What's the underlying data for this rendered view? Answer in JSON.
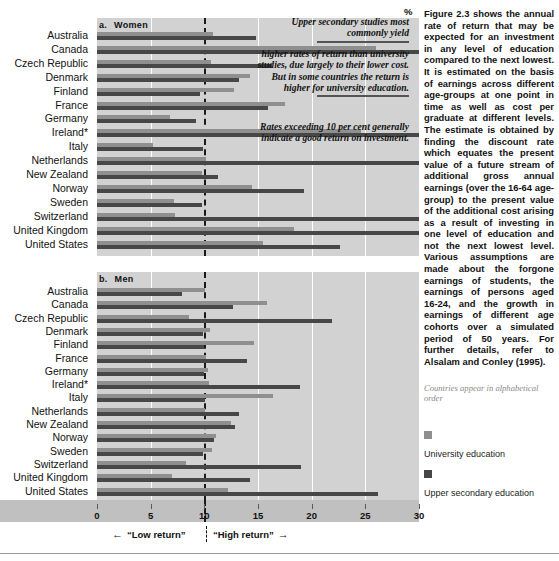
{
  "chart_data": {
    "type": "bar",
    "orientation": "horizontal",
    "xlabel": "%",
    "xlim": [
      0,
      30
    ],
    "xticks": [
      0,
      5,
      10,
      15,
      20,
      25,
      30
    ],
    "xtick_labels": [
      "0",
      "5",
      "10",
      "15",
      "20",
      "25",
      "30"
    ],
    "unit": "%",
    "grid": true,
    "reference_line": 10,
    "reference_line_style": "dashed",
    "legend_position": "right",
    "categories": [
      "Australia",
      "Canada",
      "Czech Republic",
      "Denmark",
      "Finland",
      "France",
      "Germany",
      "Ireland*",
      "Italy",
      "Netherlands",
      "New Zealand",
      "Norway",
      "Sweden",
      "Switzerland",
      "United Kingdom",
      "United States"
    ],
    "panels": [
      {
        "key": "women",
        "letter": "a.",
        "label": "Women",
        "series": [
          {
            "name": "University education",
            "color": "#8f8f8f",
            "values": [
              10.8,
              26.0,
              10.6,
              14.3,
              12.8,
              17.5,
              6.8,
              24.6,
              5.2,
              10.2,
              9.8,
              14.4,
              7.2,
              7.3,
              18.4,
              15.5
            ]
          },
          {
            "name": "Upper secondary education",
            "color": "#474747",
            "values": [
              14.8,
              30.0,
              16.3,
              13.2,
              9.6,
              15.9,
              9.2,
              30.0,
              9.9,
              30.0,
              11.3,
              19.3,
              9.8,
              30.0,
              30.0,
              22.6
            ]
          }
        ]
      },
      {
        "key": "men",
        "letter": "b.",
        "label": "Men",
        "series": [
          {
            "name": "University education",
            "color": "#8f8f8f",
            "values": [
              10.1,
              15.8,
              8.6,
              10.5,
              14.6,
              10.2,
              10.3,
              10.4,
              16.4,
              10.1,
              12.5,
              11.1,
              10.7,
              8.3,
              7.0,
              12.2
            ]
          },
          {
            "name": "Upper secondary education",
            "color": "#474747",
            "values": [
              7.9,
              12.7,
              21.9,
              9.9,
              10.0,
              14.0,
              10.0,
              18.9,
              10.1,
              13.2,
              12.9,
              10.9,
              9.9,
              19.0,
              14.3,
              26.2
            ]
          }
        ]
      }
    ],
    "annotations": [
      {
        "id": "callout-1",
        "text": "Upper secondary studies most commonly yield"
      },
      {
        "id": "callout-2",
        "text": "higher rates of return than university studies, due largely to their lower cost. But in some countries the return is higher for university education."
      },
      {
        "id": "callout-3",
        "text": "Rates exceeding 10 per cent generally indicate a good return on investment."
      }
    ],
    "axis_strip": {
      "low_label": "“Low return”",
      "high_label": "“High return”",
      "arrow_left": "←",
      "arrow_right": "→"
    }
  },
  "panel_titles": {
    "women_letter": "a.",
    "women_label": "Women",
    "men_letter": "b.",
    "men_label": "Men"
  },
  "axis": {
    "percent_symbol": "%"
  },
  "sidebar": {
    "body_text": "Figure 2.3 shows the annual rate of return that may be expected for an investment in any level of education compared to the next lowest. It is estimated on the basis of earnings across different age-groups at one point in time as well as cost per graduate at different levels. The estimate is obtained by finding the discount rate which equates the present value of a future stream of additional gross annual earnings (over the 16-64 age-group) to the present value of the additional cost arising as a result of investing in one level of education and not the next lowest level. Various assumptions are made about the forgone earnings of students, the earnings of persons aged 16-24, and the growth in earnings of different age cohorts over a simulated period of 50 years. For further details, refer to Alsalam and Conley (1995).",
    "alpha_note": "Countries appear in alphabetical order",
    "legend": [
      {
        "label": "University education",
        "color": "#8f8f8f"
      },
      {
        "label": "Upper secondary education",
        "color": "#474747"
      }
    ]
  }
}
